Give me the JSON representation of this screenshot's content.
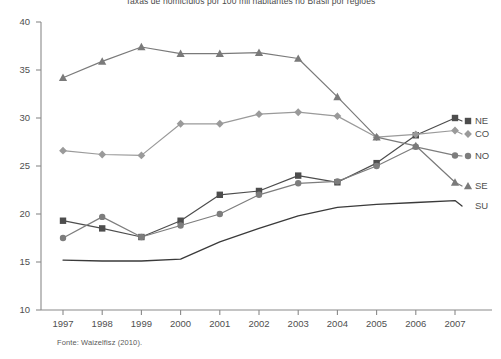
{
  "chart_data": {
    "type": "line",
    "title": "Taxas de homicídios por 100 mil habitantes no Brasil por regiões",
    "xlabel": "",
    "ylabel": "",
    "categories": [
      "1997",
      "1998",
      "1999",
      "2000",
      "2001",
      "2002",
      "2003",
      "2004",
      "2005",
      "2006",
      "2007"
    ],
    "ylim": [
      10,
      40
    ],
    "yticks": [
      "10",
      "15",
      "20",
      "25",
      "30",
      "35",
      "40"
    ],
    "grid": false,
    "legend_position": "right",
    "series": [
      {
        "name": "NE",
        "marker": "square",
        "color": "#4d4d4d",
        "values": [
          19.3,
          18.5,
          17.6,
          19.3,
          22.0,
          22.4,
          24.0,
          23.3,
          25.3,
          28.2,
          30.0
        ]
      },
      {
        "name": "CO",
        "marker": "diamond",
        "color": "#9a9a9a",
        "values": [
          26.6,
          26.2,
          26.1,
          29.4,
          29.4,
          30.4,
          30.6,
          30.2,
          28.0,
          28.3,
          28.7
        ]
      },
      {
        "name": "NO",
        "marker": "circle",
        "color": "#7d7d7d",
        "values": [
          17.5,
          19.7,
          17.6,
          18.8,
          20.0,
          22.0,
          23.2,
          23.4,
          25.0,
          27.0,
          26.1
        ]
      },
      {
        "name": "SE",
        "marker": "triangle",
        "color": "#7a7a7a",
        "values": [
          34.2,
          35.9,
          37.4,
          36.7,
          36.7,
          36.8,
          36.2,
          32.2,
          28.0,
          27.1,
          23.3
        ]
      },
      {
        "name": "SU",
        "marker": "none",
        "color": "#3a3a3a",
        "values": [
          15.2,
          15.1,
          15.1,
          15.3,
          17.1,
          18.5,
          19.8,
          20.7,
          21.0,
          21.2,
          21.4
        ]
      }
    ]
  },
  "source": {
    "note": "Fonte: Waizelfisz (2010)."
  },
  "legend": {
    "items": [
      {
        "label": "NE"
      },
      {
        "label": "CO"
      },
      {
        "label": "NO"
      },
      {
        "label": "SE"
      },
      {
        "label": "SU"
      }
    ]
  }
}
